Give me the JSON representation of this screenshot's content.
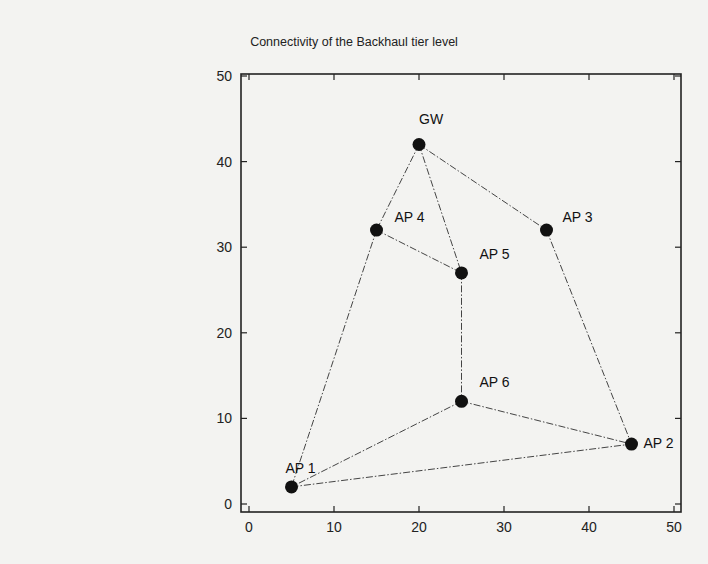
{
  "chart_data": {
    "type": "scatter",
    "title": "Connectivity of the Backhaul tier level",
    "xlabel": "",
    "ylabel": "",
    "xlim": [
      0,
      50
    ],
    "ylim": [
      0,
      50
    ],
    "grid": false,
    "x_ticks": [
      0,
      10,
      20,
      30,
      40,
      50
    ],
    "y_ticks": [
      0,
      10,
      20,
      30,
      40,
      50
    ],
    "nodes": [
      {
        "name": "GW",
        "x": 20,
        "y": 42
      },
      {
        "name": "AP 1",
        "x": 5,
        "y": 2
      },
      {
        "name": "AP 2",
        "x": 45,
        "y": 7
      },
      {
        "name": "AP 3",
        "x": 35,
        "y": 32
      },
      {
        "name": "AP 4",
        "x": 15,
        "y": 32
      },
      {
        "name": "AP 5",
        "x": 25,
        "y": 27
      },
      {
        "name": "AP 6",
        "x": 25,
        "y": 12
      }
    ],
    "edges": [
      [
        "GW",
        "AP 4"
      ],
      [
        "GW",
        "AP 5"
      ],
      [
        "GW",
        "AP 3"
      ],
      [
        "AP 4",
        "AP 5"
      ],
      [
        "AP 4",
        "AP 1"
      ],
      [
        "AP 5",
        "AP 6"
      ],
      [
        "AP 3",
        "AP 2"
      ],
      [
        "AP 6",
        "AP 1"
      ],
      [
        "AP 6",
        "AP 2"
      ],
      [
        "AP 1",
        "AP 2"
      ]
    ],
    "line_style": "dash-dot",
    "marker": "filled-circle",
    "legend": null
  }
}
